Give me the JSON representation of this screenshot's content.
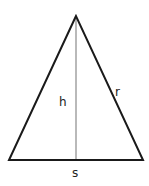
{
  "diagram": {
    "type": "isosceles-triangle",
    "labels": {
      "height": "h",
      "slant": "r",
      "base": "s"
    },
    "geometry": {
      "apex": [
        76,
        16
      ],
      "base_left": [
        9,
        160
      ],
      "base_right": [
        143,
        160
      ],
      "altitude_foot": [
        76,
        160
      ]
    },
    "colors": {
      "edge": "#1a1a1a",
      "altitude": "#8a8a8a",
      "background": "#ffffff"
    }
  }
}
